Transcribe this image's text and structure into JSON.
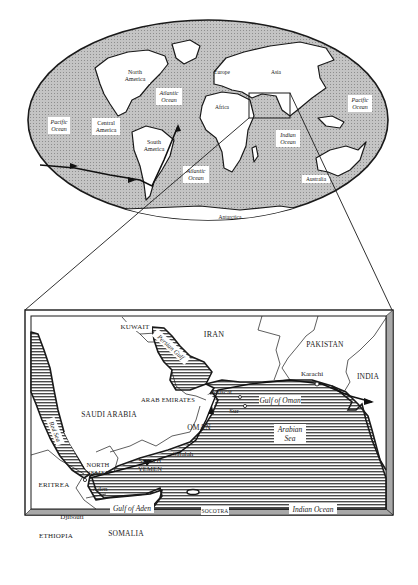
{
  "figure": {
    "type": "world-map-with-inset",
    "world_map": {
      "labels": {
        "north_america": [
          "North",
          "America"
        ],
        "central_america": [
          "Central",
          "America"
        ],
        "south_america": [
          "South",
          "America"
        ],
        "europe": "Europe",
        "asia": "Asia",
        "africa": "Africa",
        "australia": "Australia",
        "antarctica": "Antarctica",
        "pacific_west": [
          "Pacific",
          "Ocean"
        ],
        "pacific_east": [
          "Pacific",
          "Ocean"
        ],
        "atlantic_north": [
          "Atlantic",
          "Ocean"
        ],
        "atlantic_south": [
          "Atlantic",
          "Ocean"
        ],
        "indian": [
          "Indian",
          "Ocean"
        ]
      }
    },
    "inset_map": {
      "countries": {
        "kuwait": "KUWAIT",
        "iran": "IRAN",
        "pakistan": "PAKISTAN",
        "india": "INDIA",
        "saudi_arabia": "SAUDI ARABIA",
        "arab_emirates": "ARAB EMIRATES",
        "oman": "OMAN",
        "north_yemen": [
          "NORTH",
          "YEMEN"
        ],
        "south_yemen": [
          "SOUTH",
          "YEMEN"
        ],
        "eritrea": "ERITREA",
        "ethiopia": "ETHIOPIA",
        "somalia": "SOMALIA"
      },
      "cities": {
        "muscat": "Muscat",
        "sur": "Sur",
        "karachi": "Karachi",
        "salalah": "Salalah",
        "aden": "Aden",
        "djibouti": "Djibouti"
      },
      "water": {
        "persian_gulf": "Persian Gulf",
        "red_sea": "Red Sea",
        "gulf_of_oman": "Gulf of Oman",
        "arabian_sea": [
          "Arabian",
          "Sea"
        ],
        "gulf_of_aden": "Gulf of Aden",
        "indian_ocean": "Indian Ocean"
      },
      "islands": {
        "socotra": "SOCOTRA"
      }
    },
    "colors": {
      "ocean_world": "#b9b9b9",
      "land": "#ffffff",
      "outline": "#1a1a1a",
      "inset_frame_shade": "#a8a8a8",
      "sea_hatch": "#555555"
    }
  }
}
